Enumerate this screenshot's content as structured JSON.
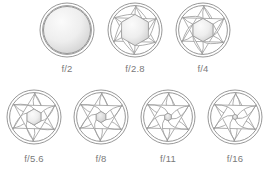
{
  "figure": {
    "type": "aperture-diagram",
    "blade_count": 6,
    "colors": {
      "stroke": "#9a9a9a",
      "ring": "#8c8c8c",
      "label": "#7a7a7a",
      "opening_fill_light": "#f2f2f2",
      "opening_fill_dark": "#c9c9c9",
      "background": "#ffffff"
    },
    "rows": [
      {
        "row_index": 0,
        "apertures": [
          {
            "label": "f/2",
            "cx": 67,
            "cy": 30,
            "ring_r": 27,
            "opening_r": 23.5,
            "label_x": 67,
            "label_y": 72,
            "fully_open": true,
            "shape": "circle"
          },
          {
            "label": "f/2.8",
            "cx": 135,
            "cy": 30,
            "ring_r": 27,
            "opening_r": 15.5,
            "label_x": 135,
            "label_y": 72,
            "fully_open": false,
            "shape": "hexagon"
          },
          {
            "label": "f/4",
            "cx": 203,
            "cy": 30,
            "ring_r": 27,
            "opening_r": 11.5,
            "label_x": 203,
            "label_y": 72,
            "fully_open": false,
            "shape": "hexagon"
          }
        ]
      },
      {
        "row_index": 1,
        "apertures": [
          {
            "label": "f/5.6",
            "cx": 34,
            "cy": 117,
            "ring_r": 27,
            "opening_r": 8.0,
            "label_x": 34,
            "label_y": 162,
            "fully_open": false,
            "shape": "hexagon"
          },
          {
            "label": "f/8",
            "cx": 101,
            "cy": 117,
            "ring_r": 27,
            "opening_r": 5.5,
            "label_x": 101,
            "label_y": 162,
            "fully_open": false,
            "shape": "hexagon"
          },
          {
            "label": "f/11",
            "cx": 168,
            "cy": 117,
            "ring_r": 27,
            "opening_r": 3.8,
            "label_x": 168,
            "label_y": 162,
            "fully_open": false,
            "shape": "hexagon"
          },
          {
            "label": "f/16",
            "cx": 235,
            "cy": 117,
            "ring_r": 27,
            "opening_r": 2.6,
            "label_x": 235,
            "label_y": 162,
            "fully_open": false,
            "shape": "hexagon"
          }
        ]
      }
    ],
    "labels_in_order": [
      "f/2",
      "f/2.8",
      "f/4",
      "f/5.6",
      "f/8",
      "f/11",
      "f/16"
    ]
  }
}
